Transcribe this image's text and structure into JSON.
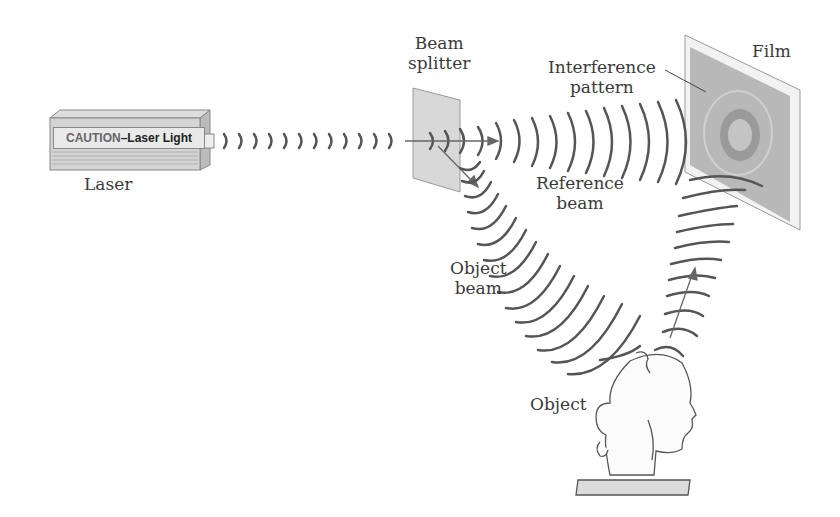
{
  "diagram": {
    "labels": {
      "laser": "Laser",
      "laser_caution_prefix": "CAUTION",
      "laser_caution_suffix": "–Laser Light",
      "beam_splitter_line1": "Beam",
      "beam_splitter_line2": "splitter",
      "interference_line1": "Interference",
      "interference_line2": "pattern",
      "film": "Film",
      "reference_line1": "Reference",
      "reference_line2": "beam",
      "object_beam_line1": "Object",
      "object_beam_line2": "beam",
      "object": "Object"
    },
    "colors": {
      "wave": "#555555",
      "arrow": "#666666",
      "film": "#bdbdbd",
      "splitter": "#d8d8d8"
    }
  }
}
